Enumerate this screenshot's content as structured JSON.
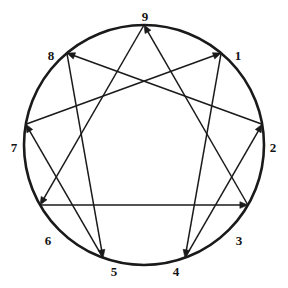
{
  "figure": {
    "name": "enneagram-diagram",
    "stroke_color": "#1a1a1a",
    "label_color": "#141414",
    "background_color": "#ffffff",
    "circle": {
      "center_x": 144,
      "center_y": 145,
      "radius": 120,
      "stroke_width": 2.6
    },
    "line_stroke_width": 1.5,
    "arrow_size": 8
  },
  "nodes": [
    {
      "id": "1",
      "label": "1",
      "angle_deg": -50,
      "x": 221.1,
      "y": 53.1,
      "label_x": 238,
      "label_y": 56
    },
    {
      "id": "2",
      "label": "2",
      "angle_deg": -10,
      "x": 262.2,
      "y": 124.2,
      "label_x": 273,
      "label_y": 148
    },
    {
      "id": "3",
      "label": "3",
      "angle_deg": 30,
      "x": 247.9,
      "y": 205.0,
      "label_x": 239,
      "label_y": 241
    },
    {
      "id": "4",
      "label": "4",
      "angle_deg": 70,
      "x": 185.0,
      "y": 257.8,
      "label_x": 176,
      "label_y": 272
    },
    {
      "id": "5",
      "label": "5",
      "angle_deg": 110,
      "x": 103.0,
      "y": 257.8,
      "label_x": 114,
      "label_y": 272
    },
    {
      "id": "6",
      "label": "6",
      "angle_deg": 150,
      "x": 40.1,
      "y": 205.0,
      "label_x": 48,
      "label_y": 241
    },
    {
      "id": "7",
      "label": "7",
      "angle_deg": 190,
      "x": 25.8,
      "y": 124.2,
      "label_x": 14,
      "label_y": 148
    },
    {
      "id": "8",
      "label": "8",
      "angle_deg": 230,
      "x": 66.9,
      "y": 53.1,
      "label_x": 51,
      "label_y": 56
    },
    {
      "id": "9",
      "label": "9",
      "angle_deg": 270,
      "x": 144.0,
      "y": 25.0,
      "label_x": 145,
      "label_y": 17
    }
  ],
  "connections": {
    "triangle": {
      "name": "three-six-nine-triangle",
      "sequence": [
        "9",
        "6",
        "3",
        "9"
      ],
      "edges": [
        {
          "from": "9",
          "to": "6",
          "arrow_at": "6"
        },
        {
          "from": "6",
          "to": "3",
          "arrow_at": "3"
        },
        {
          "from": "3",
          "to": "9",
          "arrow_at": "9"
        }
      ]
    },
    "hexad": {
      "name": "one-four-two-eight-five-seven-hexad",
      "sequence": [
        "1",
        "4",
        "2",
        "8",
        "5",
        "7",
        "1"
      ],
      "edges": [
        {
          "from": "1",
          "to": "4",
          "arrow_at": "4"
        },
        {
          "from": "4",
          "to": "2",
          "arrow_at": "2"
        },
        {
          "from": "2",
          "to": "8",
          "arrow_at": "8"
        },
        {
          "from": "8",
          "to": "5",
          "arrow_at": "5"
        },
        {
          "from": "5",
          "to": "7",
          "arrow_at": "7"
        },
        {
          "from": "7",
          "to": "1",
          "arrow_at": "1"
        }
      ]
    }
  }
}
